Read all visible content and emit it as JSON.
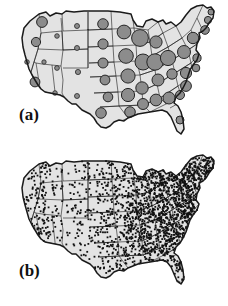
{
  "figure": {
    "title": "",
    "background_color": "#ffffff",
    "width": 228,
    "height": 306,
    "panels": [
      {
        "id": "a",
        "label": "(a)",
        "caption": "",
        "type": "proportional-symbol-map"
      },
      {
        "id": "b",
        "label": "(b)",
        "caption": "",
        "type": "dot-density-map"
      }
    ]
  },
  "colors": {
    "state_fill": "#e3e3e3",
    "state_stroke": "#1a1a1a",
    "circle_fill": "#8c8c8c",
    "circle_stroke": "#262626",
    "dot_fill": "#111111",
    "label_color": "#111111",
    "background": "#ffffff"
  },
  "chart_data": [
    {
      "id": "a",
      "type": "scatter",
      "title": "(a)",
      "subtitle": "",
      "xlabel": "",
      "ylabel": "",
      "legend": [],
      "grid": false,
      "projection": "albers-usa",
      "symbol": "circle",
      "symbol_fill": "#8c8c8c",
      "symbol_stroke": "#262626",
      "size_encoding": "radius proportional to value",
      "note": "Graduated circle map of the contiguous United States; circle radius encodes magnitude per state/locale. Largest symbols cluster in the Midwest, Mid-Atlantic and Southeast; smallest symbols appear across the Mountain West.",
      "points": [
        {
          "label": "WA",
          "x": 42,
          "y": 22,
          "r": 5.4,
          "value": 29
        },
        {
          "label": "OR",
          "x": 36,
          "y": 42,
          "r": 4.6,
          "value": 21
        },
        {
          "label": "CA-N",
          "x": 27,
          "y": 62,
          "r": 2.3,
          "value": 5
        },
        {
          "label": "CA-S",
          "x": 35,
          "y": 82,
          "r": 4.9,
          "value": 24
        },
        {
          "label": "NV",
          "x": 44,
          "y": 62,
          "r": 2.2,
          "value": 5
        },
        {
          "label": "ID",
          "x": 57,
          "y": 36,
          "r": 2.3,
          "value": 5
        },
        {
          "label": "UT",
          "x": 57,
          "y": 68,
          "r": 2.4,
          "value": 6
        },
        {
          "label": "AZ",
          "x": 55,
          "y": 93,
          "r": 2.3,
          "value": 5
        },
        {
          "label": "MT",
          "x": 77,
          "y": 26,
          "r": 2.5,
          "value": 6
        },
        {
          "label": "WY",
          "x": 77,
          "y": 48,
          "r": 2.5,
          "value": 6
        },
        {
          "label": "CO",
          "x": 78,
          "y": 72,
          "r": 2.6,
          "value": 7
        },
        {
          "label": "NM",
          "x": 77,
          "y": 96,
          "r": 2.5,
          "value": 6
        },
        {
          "label": "ND",
          "x": 103,
          "y": 24,
          "r": 5.3,
          "value": 28
        },
        {
          "label": "SD",
          "x": 103,
          "y": 44,
          "r": 5.1,
          "value": 26
        },
        {
          "label": "NE",
          "x": 103,
          "y": 63,
          "r": 5.0,
          "value": 25
        },
        {
          "label": "KS",
          "x": 105,
          "y": 80,
          "r": 4.9,
          "value": 24
        },
        {
          "label": "OK",
          "x": 108,
          "y": 97,
          "r": 4.8,
          "value": 23
        },
        {
          "label": "TX",
          "x": 101,
          "y": 113,
          "r": 5.3,
          "value": 28
        },
        {
          "label": "MN",
          "x": 124,
          "y": 32,
          "r": 6.9,
          "value": 46
        },
        {
          "label": "IA",
          "x": 126,
          "y": 56,
          "r": 7.3,
          "value": 51
        },
        {
          "label": "MO",
          "x": 128,
          "y": 76,
          "r": 7.1,
          "value": 49
        },
        {
          "label": "AR",
          "x": 128,
          "y": 95,
          "r": 6.6,
          "value": 43
        },
        {
          "label": "LA",
          "x": 130,
          "y": 112,
          "r": 5.3,
          "value": 28
        },
        {
          "label": "WI",
          "x": 140,
          "y": 38,
          "r": 8.4,
          "value": 64
        },
        {
          "label": "IL",
          "x": 143,
          "y": 62,
          "r": 8.0,
          "value": 59
        },
        {
          "label": "TN-W",
          "x": 142,
          "y": 88,
          "r": 6.2,
          "value": 38
        },
        {
          "label": "MS",
          "x": 143,
          "y": 104,
          "r": 5.5,
          "value": 30
        },
        {
          "label": "MI",
          "x": 156,
          "y": 42,
          "r": 6.1,
          "value": 37
        },
        {
          "label": "IN",
          "x": 155,
          "y": 62,
          "r": 8.2,
          "value": 61
        },
        {
          "label": "KY",
          "x": 158,
          "y": 80,
          "r": 6.0,
          "value": 36
        },
        {
          "label": "AL",
          "x": 156,
          "y": 100,
          "r": 5.9,
          "value": 35
        },
        {
          "label": "OH",
          "x": 168,
          "y": 58,
          "r": 7.6,
          "value": 54
        },
        {
          "label": "WV",
          "x": 172,
          "y": 74,
          "r": 5.2,
          "value": 27
        },
        {
          "label": "GA",
          "x": 169,
          "y": 98,
          "r": 6.0,
          "value": 36
        },
        {
          "label": "PA",
          "x": 184,
          "y": 52,
          "r": 6.5,
          "value": 42
        },
        {
          "label": "VA",
          "x": 186,
          "y": 73,
          "r": 5.6,
          "value": 31
        },
        {
          "label": "NC",
          "x": 186,
          "y": 86,
          "r": 5.4,
          "value": 29
        },
        {
          "label": "SC",
          "x": 180,
          "y": 95,
          "r": 4.5,
          "value": 20
        },
        {
          "label": "FL",
          "x": 180,
          "y": 120,
          "r": 4.0,
          "value": 16
        },
        {
          "label": "NY",
          "x": 193,
          "y": 38,
          "r": 5.7,
          "value": 32
        },
        {
          "label": "NJ",
          "x": 197,
          "y": 58,
          "r": 4.1,
          "value": 17
        },
        {
          "label": "MD",
          "x": 196,
          "y": 68,
          "r": 3.8,
          "value": 14
        },
        {
          "label": "NE-1",
          "x": 205,
          "y": 30,
          "r": 4.3,
          "value": 19
        },
        {
          "label": "NE-2",
          "x": 208,
          "y": 20,
          "r": 3.6,
          "value": 13
        },
        {
          "label": "ME",
          "x": 211,
          "y": 12,
          "r": 3.0,
          "value": 9
        }
      ],
      "value_range": [
        5,
        64
      ],
      "radius_range": [
        2.2,
        8.4
      ]
    },
    {
      "id": "b",
      "type": "scatter",
      "title": "(b)",
      "subtitle": "",
      "xlabel": "",
      "ylabel": "",
      "legend": [],
      "grid": false,
      "projection": "albers-usa",
      "symbol": "dot",
      "symbol_fill": "#111111",
      "dot_size_px": 1.8,
      "approx_dot_count": 1850,
      "note": "Dot-density map of the contiguous United States; each dot marks one observation. Density is very high east of the Mississippi and sparse across the Mountain West and Great Basin.",
      "density_regions": [
        {
          "region": "Pacific Northwest",
          "relative_density": 0.3
        },
        {
          "region": "California",
          "relative_density": 0.28
        },
        {
          "region": "Mountain West",
          "relative_density": 0.12
        },
        {
          "region": "Great Plains",
          "relative_density": 0.22
        },
        {
          "region": "Upper Midwest",
          "relative_density": 0.62
        },
        {
          "region": "Ohio Valley",
          "relative_density": 0.95
        },
        {
          "region": "Mid-Atlantic",
          "relative_density": 1.0
        },
        {
          "region": "Southeast",
          "relative_density": 0.85
        },
        {
          "region": "Texas",
          "relative_density": 0.4
        },
        {
          "region": "Florida",
          "relative_density": 0.45
        },
        {
          "region": "New England",
          "relative_density": 0.7
        }
      ]
    }
  ]
}
